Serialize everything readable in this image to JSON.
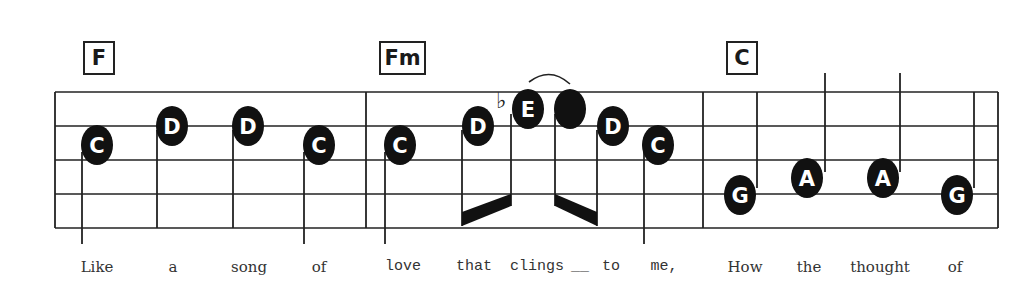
{
  "score": {
    "measures": [
      {
        "chord": "F",
        "notes": [
          {
            "name": "C",
            "x": 97,
            "y": 145,
            "stem": "down"
          },
          {
            "name": "D",
            "x": 172,
            "y": 126,
            "stem": "down"
          },
          {
            "name": "D",
            "x": 248,
            "y": 126,
            "stem": "down"
          },
          {
            "name": "C",
            "x": 319,
            "y": 145,
            "stem": "down"
          }
        ],
        "lyrics": [
          {
            "text": "Like",
            "x": 97
          },
          {
            "text": "a",
            "x": 173
          },
          {
            "text": "song",
            "x": 249
          },
          {
            "text": "of",
            "x": 319
          }
        ]
      },
      {
        "chord": "Fm",
        "notes": [
          {
            "name": "C",
            "x": 400,
            "y": 145,
            "stem": "down"
          },
          {
            "name": "D",
            "x": 478,
            "y": 126,
            "stem": "beam"
          },
          {
            "name": "E",
            "x": 528,
            "y": 109,
            "stem": "beam",
            "accidental": "♭"
          },
          {
            "name": "",
            "x": 570,
            "y": 109,
            "stem": "beam",
            "filled": true
          },
          {
            "name": "D",
            "x": 613,
            "y": 126,
            "stem": "beam"
          },
          {
            "name": "C",
            "x": 658,
            "y": 145,
            "stem": "down"
          }
        ],
        "lyrics": [
          {
            "text": "love",
            "x": 403
          },
          {
            "text": "that",
            "x": 474
          },
          {
            "text": "clings",
            "x": 537
          },
          {
            "text": "__",
            "x": 580
          },
          {
            "text": "to",
            "x": 611
          },
          {
            "text": "me,",
            "x": 664
          }
        ]
      },
      {
        "chord": "C",
        "notes": [
          {
            "name": "G",
            "x": 740,
            "y": 195,
            "stem": "up"
          },
          {
            "name": "A",
            "x": 807,
            "y": 178,
            "stem": "up"
          },
          {
            "name": "A",
            "x": 883,
            "y": 178,
            "stem": "up"
          },
          {
            "name": "G",
            "x": 957,
            "y": 195,
            "stem": "up"
          }
        ],
        "lyrics": [
          {
            "text": "How",
            "x": 745
          },
          {
            "text": "the",
            "x": 809
          },
          {
            "text": "thought",
            "x": 880
          },
          {
            "text": "of",
            "x": 955
          }
        ]
      }
    ]
  }
}
